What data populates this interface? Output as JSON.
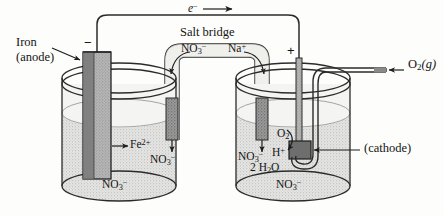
{
  "figure": {
    "colors": {
      "ink": "#1a1a1a",
      "line": "#2a2a2a",
      "solution": "#cfcfcf",
      "electrode_iron": "#8f8f8f",
      "electrode_dark": "#6b6b6b",
      "salt_bridge_fill": "#c9c9c9",
      "beaker_glass": "#f2f2f0",
      "page_bg": "#fdfdfb"
    }
  },
  "labels": {
    "electron_flow": "e",
    "electron_flow_sup": "−",
    "salt_bridge": "Salt bridge",
    "bridge_anion": "NO",
    "bridge_anion_sub": "3",
    "bridge_anion_sup": "−",
    "bridge_cation": "Na",
    "bridge_cation_sup": "+",
    "iron": "Iron",
    "anode": "(anode)",
    "cathode": "(cathode)",
    "oxygen_gas": "O",
    "oxygen_gas_sub": "2",
    "oxygen_gas_state": "(g)",
    "iron_ion": "Fe",
    "iron_ion_sup": "2+",
    "nitrate_left_mid": "NO",
    "nitrate_left_mid_sub": "3",
    "nitrate_left_mid_sup": "−",
    "nitrate_left_bottom": "NO",
    "nitrate_left_bottom_sub": "3",
    "nitrate_left_bottom_sup": "−",
    "nitrate_right_mid": "NO",
    "nitrate_right_mid_sub": "3",
    "nitrate_right_mid_sup": "−",
    "nitrate_right_bottom": "NO",
    "nitrate_right_bottom_sub": "3",
    "nitrate_right_bottom_sup": "−",
    "oxygen_species": "O",
    "oxygen_species_sub": "2",
    "proton": "H",
    "proton_sup": "+",
    "water": "2 H",
    "water_sub": "2",
    "water_tail": "O",
    "minus_sign": "−",
    "plus_sign": "+"
  }
}
